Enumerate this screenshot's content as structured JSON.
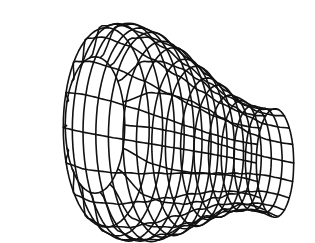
{
  "figure": {
    "kind": "wireframe-surface-of-revolution",
    "background": "#ffffff",
    "line_color": "#111111",
    "mesh": {
      "axial_lines": 16,
      "circumferential_lines": 18
    },
    "profile": {
      "description": "Radius along axis: large bulbous left end narrowing to a waist then slight flare at right end",
      "t": [
        0.0,
        0.08,
        0.18,
        0.3,
        0.42,
        0.54,
        0.66,
        0.76,
        0.86,
        0.94,
        1.0
      ],
      "radius": [
        0.62,
        0.95,
        1.0,
        0.97,
        0.88,
        0.76,
        0.64,
        0.55,
        0.5,
        0.5,
        0.52
      ]
    },
    "view": {
      "left_end": [
        95,
        125
      ],
      "right_end": [
        275,
        163
      ],
      "scale_y": 110,
      "scale_x": 48
    }
  }
}
